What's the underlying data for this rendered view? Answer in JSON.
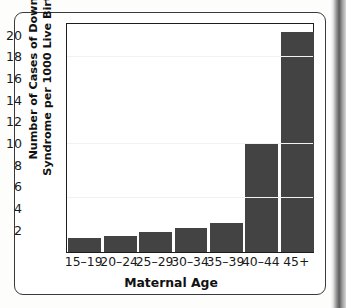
{
  "figure": {
    "frame_visible": true,
    "bar_color": "#434343",
    "axis_color": "#1d1d1d"
  },
  "chart_data": {
    "type": "bar",
    "title": "",
    "subtitle": "",
    "xlabel": "Maternal Age",
    "ylabel": "Number of Cases of Down Syndrome per 1000 Live Births",
    "ylabel_lines": [
      "Number of Cases of Down",
      "Syndrome per 1000 Live Births"
    ],
    "categories": [
      "15–19",
      "20–24",
      "25–29",
      "30–34",
      "35–39",
      "40–44",
      "45+"
    ],
    "values": [
      1.3,
      1.5,
      1.8,
      2.2,
      2.7,
      10.0,
      20.3
    ],
    "ylim": [
      0,
      21.2
    ],
    "xlim_categories": 7,
    "yticks": [
      2,
      4,
      6,
      8,
      10,
      12,
      14,
      16,
      18,
      20
    ],
    "ytick_labels": [
      "2",
      "4",
      "6",
      "8",
      "10",
      "12",
      "14",
      "16",
      "18",
      "20"
    ],
    "grid": false,
    "legend": null,
    "legend_position": "none",
    "annotations": []
  }
}
